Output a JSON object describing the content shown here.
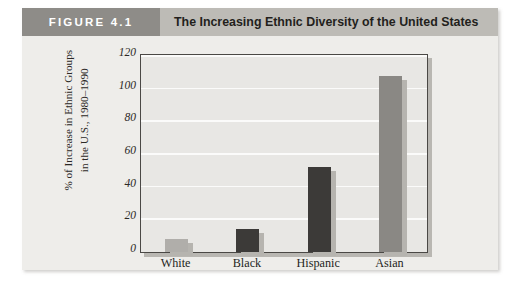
{
  "figure": {
    "tag": "FIGURE 4.1",
    "title": "The Increasing Ethnic Diversity of the United States"
  },
  "colors": {
    "card_background": "#eeedea",
    "header_band": "#bdbbb6",
    "tag_background": "#8e8c88",
    "tag_text": "#ffffff",
    "plot_background": "#e8e7e4",
    "plot_border": "#4a4845",
    "gridline": "#fbfbfa",
    "bar_light": "#b0aeaa",
    "bar_dark": "#3c3a38",
    "bar_medium": "#8a8884",
    "bar_shadow": "#b6b4af"
  },
  "chart_data": {
    "type": "bar",
    "title": "The Increasing Ethnic Diversity of the United States",
    "categories": [
      "White",
      "Black",
      "Hispanic",
      "Asian"
    ],
    "values": [
      8,
      14,
      52,
      108
    ],
    "bar_colors": [
      "#b0aeaa",
      "#3c3a38",
      "#3c3a38",
      "#8a8884"
    ],
    "xlabel": "",
    "ylabel_line1": "% of Increase in Ethnic Groups",
    "ylabel_line2": "in the U.S., 1980–1990",
    "ylim": [
      0,
      120
    ],
    "yticks": [
      0,
      20,
      40,
      60,
      80,
      100,
      120
    ],
    "ytick_labels": [
      "0",
      "20",
      "40",
      "60",
      "80",
      "100",
      "120"
    ],
    "grid": true,
    "legend": false
  }
}
